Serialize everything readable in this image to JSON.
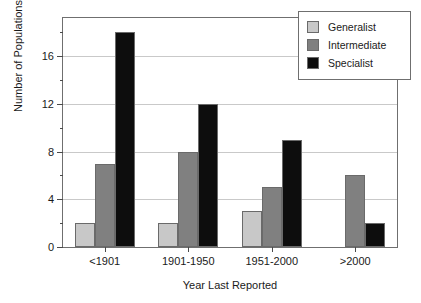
{
  "chart_data": {
    "type": "bar",
    "title": "",
    "xlabel": "Year Last Reported",
    "ylabel": "Number of Populations",
    "categories": [
      "<1901",
      "1901-1950",
      "1951-2000",
      ">2000"
    ],
    "series": [
      {
        "name": "Generalist",
        "color": "#c8c8c8",
        "values": [
          2,
          2,
          3,
          0
        ]
      },
      {
        "name": "Intermediate",
        "color": "#808080",
        "values": [
          7,
          8,
          5,
          6
        ]
      },
      {
        "name": "Specialist",
        "color": "#0d0d0d",
        "values": [
          18,
          12,
          9,
          2
        ]
      }
    ],
    "ylim": [
      0,
      19.2
    ],
    "ytick_major": [
      0,
      4,
      8,
      12,
      16
    ],
    "ytick_minor": [
      2,
      6,
      10,
      14,
      18
    ],
    "ytick_labels": [
      "0",
      "4",
      "8",
      "12",
      "16"
    ],
    "grid": "horizontal-major",
    "legend_position": "top-right",
    "bar_edge_color": "#6a6a6a",
    "axis_color": "#6f6f6f",
    "grid_color": "#c9c9c9"
  }
}
